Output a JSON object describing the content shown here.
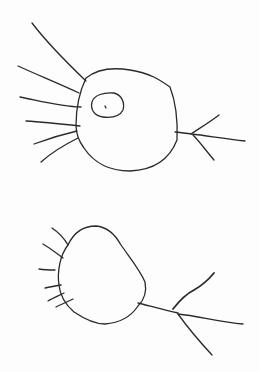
{
  "drawing": {
    "description": "Hand-drawn pencil sketch of two neuron-like cells",
    "stroke_color": "#2a2a2a",
    "background": "#fdfdfd",
    "figures": [
      {
        "name": "top-cell",
        "has_nucleus": true
      },
      {
        "name": "bottom-cell",
        "has_nucleus": false
      }
    ]
  }
}
